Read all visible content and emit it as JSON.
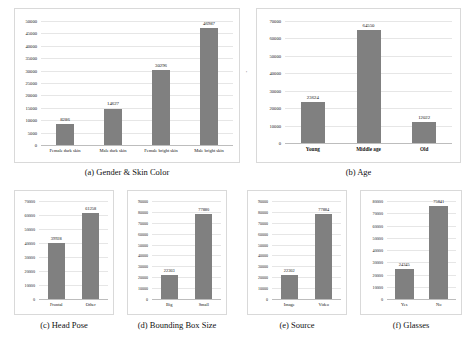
{
  "figure": {
    "background": "#ffffff",
    "bar_color": "#808080",
    "grid_color": "#e6e6e6",
    "border_color": "#d9d9d9"
  },
  "chart_data": [
    {
      "id": "a",
      "type": "bar",
      "title": "(a) Gender & Skin Color",
      "xlabel": "",
      "ylabel": "",
      "categories": [
        "Female dark skin",
        "Male dark skin",
        "Female bright skin",
        "Male bright skin"
      ],
      "values": [
        8286,
        14627,
        30296,
        46987
      ],
      "value_labels": [
        "8286",
        "14627",
        "30296",
        "46987"
      ],
      "yticks": [
        0,
        5000,
        10000,
        15000,
        20000,
        25000,
        30000,
        35000,
        40000,
        45000,
        50000
      ],
      "ytick_labels": [
        "0",
        "5000",
        "10000",
        "15000",
        "20000",
        "25000",
        "30000",
        "35000",
        "40000",
        "45000",
        "50000"
      ],
      "ylim": [
        0,
        50000
      ],
      "grid": true,
      "legend": "none"
    },
    {
      "id": "b",
      "type": "bar",
      "title": "(b) Age",
      "xlabel": "",
      "ylabel": "",
      "categories": [
        "Young",
        "Middle age",
        "Old"
      ],
      "values": [
        23624,
        64550,
        12022
      ],
      "value_labels": [
        "23624",
        "64550",
        "12022"
      ],
      "yticks": [
        0,
        10000,
        20000,
        30000,
        40000,
        50000,
        60000,
        70000
      ],
      "ytick_labels": [
        "0",
        "10000",
        "20000",
        "30000",
        "40000",
        "50000",
        "60000",
        "70000"
      ],
      "ylim": [
        0,
        70000
      ],
      "grid": true,
      "legend": "none"
    },
    {
      "id": "c",
      "type": "bar",
      "title": "(c) Head Pose",
      "xlabel": "",
      "ylabel": "",
      "categories": [
        "Frontal",
        "Other"
      ],
      "values": [
        39928,
        61258
      ],
      "value_labels": [
        "39928",
        "61258"
      ],
      "yticks": [
        0,
        10000,
        20000,
        30000,
        40000,
        50000,
        60000,
        70000
      ],
      "ytick_labels": [
        "0",
        "10000",
        "20000",
        "30000",
        "40000",
        "50000",
        "60000",
        "70000"
      ],
      "ylim": [
        0,
        70000
      ],
      "grid": true,
      "legend": "none"
    },
    {
      "id": "d",
      "type": "bar",
      "title": "(d) Bounding Box Size",
      "xlabel": "",
      "ylabel": "",
      "categories": [
        "Big",
        "Small"
      ],
      "values": [
        22303,
        77880
      ],
      "value_labels": [
        "22303",
        "77880"
      ],
      "yticks": [
        0,
        10000,
        20000,
        30000,
        40000,
        50000,
        60000,
        70000,
        80000,
        90000
      ],
      "ytick_labels": [
        "0",
        "10000",
        "20000",
        "30000",
        "40000",
        "50000",
        "60000",
        "70000",
        "80000",
        "90000"
      ],
      "ylim": [
        0,
        90000
      ],
      "grid": true,
      "legend": "none"
    },
    {
      "id": "e",
      "type": "bar",
      "title": "(e) Source",
      "xlabel": "",
      "ylabel": "",
      "categories": [
        "Image",
        "Video"
      ],
      "values": [
        22302,
        77884
      ],
      "value_labels": [
        "22302",
        "77884"
      ],
      "yticks": [
        0,
        10000,
        20000,
        30000,
        40000,
        50000,
        60000,
        70000,
        80000,
        90000
      ],
      "ytick_labels": [
        "0",
        "10000",
        "20000",
        "30000",
        "40000",
        "50000",
        "60000",
        "70000",
        "80000",
        "90000"
      ],
      "ylim": [
        0,
        90000
      ],
      "grid": true,
      "legend": "none"
    },
    {
      "id": "f",
      "type": "bar",
      "title": "(f) Glasses",
      "xlabel": "",
      "ylabel": "",
      "categories": [
        "Yes",
        "No"
      ],
      "values": [
        24345,
        75841
      ],
      "value_labels": [
        "24345",
        "75841"
      ],
      "yticks": [
        0,
        10000,
        20000,
        30000,
        40000,
        50000,
        60000,
        70000,
        80000
      ],
      "ytick_labels": [
        "0",
        "10000",
        "20000",
        "30000",
        "40000",
        "50000",
        "60000",
        "70000",
        "80000"
      ],
      "ylim": [
        0,
        80000
      ],
      "grid": true,
      "legend": "none"
    }
  ],
  "annotations": {
    "stray_mark": "'"
  }
}
